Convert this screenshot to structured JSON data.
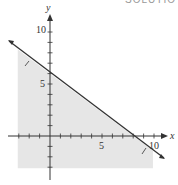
{
  "header": {
    "cut_text": "SOLUTIO"
  },
  "chart_data": {
    "type": "line",
    "title": "",
    "xlabel": "x",
    "ylabel": "y",
    "xlim": [
      -4,
      11
    ],
    "ylim": [
      -4,
      11
    ],
    "x_tick_labels": [
      "5",
      "10"
    ],
    "y_tick_labels": [
      "5",
      "10"
    ],
    "grid": false,
    "boundary_line": {
      "equation": "3x + 4y = 24",
      "x_intercept": 8,
      "y_intercept": 6,
      "slope": -0.75,
      "style": "solid"
    },
    "shaded_region": {
      "inequality": "3x + 4y <= 24",
      "side": "below",
      "color": "#e6e6e6"
    },
    "series": [
      {
        "name": "boundary",
        "x": [
          -4,
          11
        ],
        "y": [
          9,
          -2.25
        ]
      }
    ],
    "colors": {
      "line": "#333333",
      "shade": "#e6e6e6",
      "axis": "#333333"
    }
  }
}
